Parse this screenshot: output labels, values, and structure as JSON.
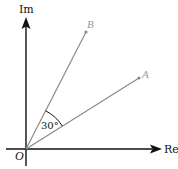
{
  "diagram": {
    "type": "complex-plane (Argand diagram)",
    "axes": {
      "real_label": "Re",
      "imaginary_label": "Im",
      "origin_label": "O"
    },
    "points": [
      {
        "name": "A",
        "label": "A"
      },
      {
        "name": "B",
        "label": "B"
      }
    ],
    "angle": {
      "between": [
        "OA",
        "OB"
      ],
      "label": "30°"
    },
    "colors": {
      "axes": "#111111",
      "rays": "#8a8a8a",
      "point_labels": "#9a9a9a",
      "background": "#ffffff"
    }
  }
}
